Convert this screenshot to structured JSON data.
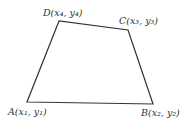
{
  "diagram": {
    "type": "quadrilateral",
    "stroke_color": "#333333",
    "background": "#ffffff",
    "vertices": [
      {
        "name": "A",
        "label": "A(x₁, y₁)",
        "x": 27,
        "y": 102
      },
      {
        "name": "B",
        "label": "B(x₂, y₂)",
        "x": 153,
        "y": 104
      },
      {
        "name": "C",
        "label": "C(x₃, y₃)",
        "x": 128,
        "y": 30
      },
      {
        "name": "D",
        "label": "D(x₄, y₄)",
        "x": 59,
        "y": 21
      }
    ],
    "edges": [
      [
        "A",
        "B"
      ],
      [
        "B",
        "C"
      ],
      [
        "C",
        "D"
      ],
      [
        "D",
        "A"
      ]
    ]
  }
}
